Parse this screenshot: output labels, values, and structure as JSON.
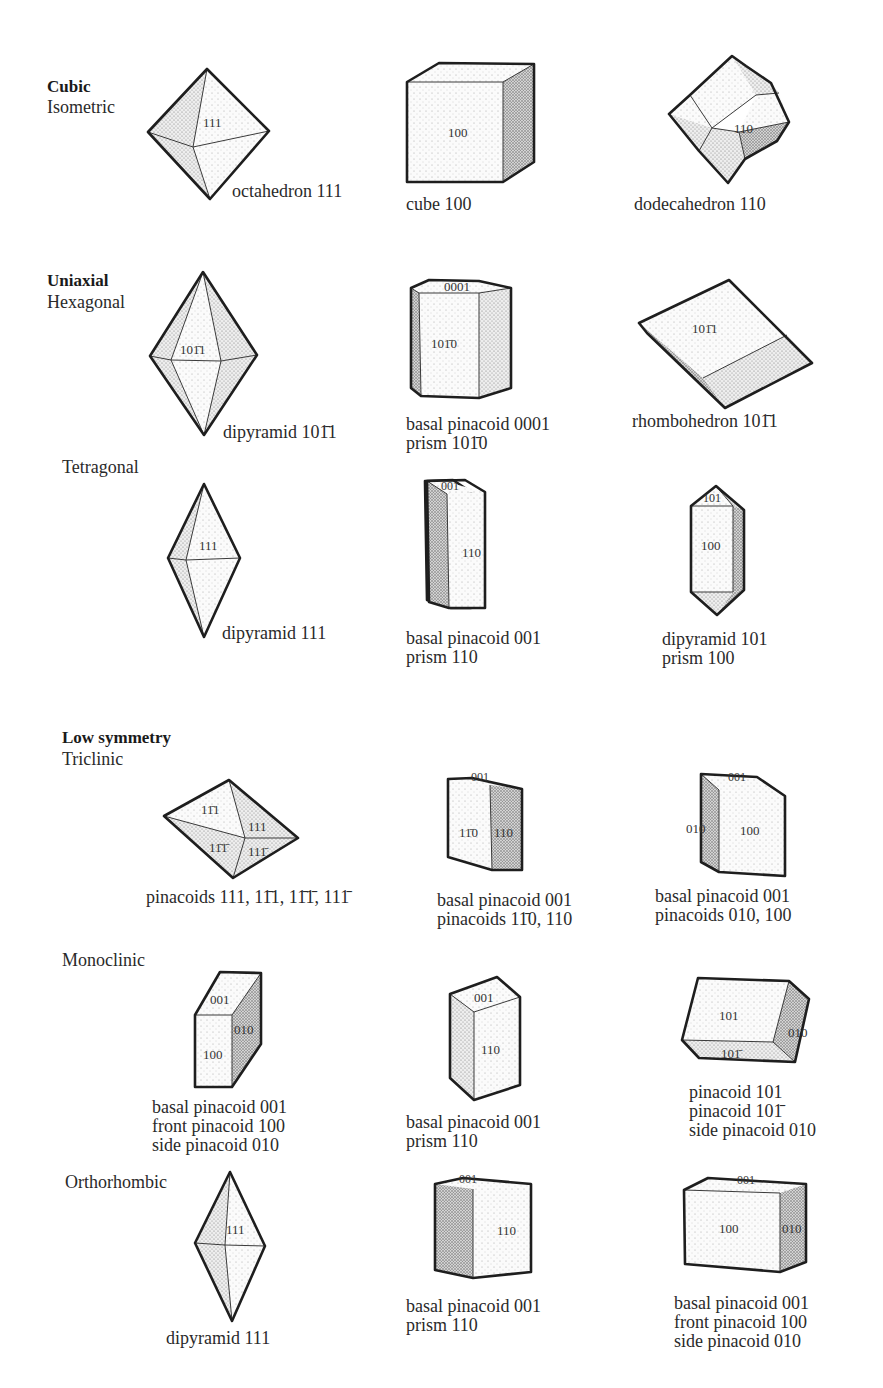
{
  "groups": {
    "cubic": {
      "title": "Cubic",
      "systems": {
        "isometric": "Isometric"
      }
    },
    "uniaxial": {
      "title": "Uniaxial",
      "systems": {
        "hexagonal": "Hexagonal",
        "tetragonal": "Tetragonal"
      }
    },
    "low_symmetry": {
      "title": "Low symmetry",
      "systems": {
        "triclinic": "Triclinic",
        "monoclinic": "Monoclinic",
        "orthorhombic": "Orthorhombic"
      }
    }
  },
  "crystals": {
    "octahedron": {
      "face": "111",
      "caption": [
        "octahedron 111"
      ]
    },
    "cube": {
      "face": "100",
      "caption": [
        "cube 100"
      ]
    },
    "dodecahedron": {
      "face": "110",
      "caption": [
        "dodecahedron 110"
      ]
    },
    "hex_dipyramid": {
      "face": "101̄1",
      "caption": [
        "dipyramid 101̄1"
      ]
    },
    "hex_prism": {
      "faces": [
        "0001",
        "101̄0"
      ],
      "caption": [
        "basal pinacoid 0001",
        "prism 101̄0"
      ]
    },
    "rhombohedron": {
      "face": "101̄1",
      "caption": [
        "rhombohedron 101̄1"
      ]
    },
    "tet_dipyramid": {
      "face": "111",
      "caption": [
        "dipyramid 111"
      ]
    },
    "tet_prism": {
      "faces": [
        "001",
        "110"
      ],
      "caption": [
        "basal pinacoid 001",
        "prism 110"
      ]
    },
    "tet_prism_dipyramid": {
      "faces": [
        "101",
        "100"
      ],
      "caption": [
        "dipyramid 101",
        "prism 100"
      ]
    },
    "tri_pinacoids": {
      "faces": [
        "11̄1",
        "111",
        "11̄1̄",
        "111̄"
      ],
      "caption": [
        "pinacoids 111, 11̄1, 11̄1̄, 111̄"
      ]
    },
    "tri_prism_a": {
      "faces": [
        "001",
        "11̄0",
        "110"
      ],
      "caption": [
        "basal pinacoid 001",
        "pinacoids 11̄0, 110"
      ]
    },
    "tri_prism_b": {
      "faces": [
        "001",
        "010",
        "100"
      ],
      "caption": [
        "basal pinacoid 001",
        "pinacoids 010, 100"
      ]
    },
    "mono_a": {
      "faces": [
        "001",
        "010",
        "100"
      ],
      "caption": [
        "basal pinacoid 001",
        "front pinacoid 100",
        "side pinacoid 010"
      ]
    },
    "mono_b": {
      "faces": [
        "001",
        "110"
      ],
      "caption": [
        "basal pinacoid 001",
        "prism 110"
      ]
    },
    "mono_c": {
      "faces": [
        "101",
        "010",
        "101̄"
      ],
      "caption": [
        "pinacoid 101",
        "pinacoid 101̄",
        "side pinacoid 010"
      ]
    },
    "ortho_dipyramid": {
      "face": "111",
      "caption": [
        "dipyramid 111"
      ]
    },
    "ortho_prism": {
      "faces": [
        "001",
        "110"
      ],
      "caption": [
        "basal pinacoid 001",
        "prism 110"
      ]
    },
    "ortho_box": {
      "faces": [
        "001",
        "100",
        "010"
      ],
      "caption": [
        "basal pinacoid 001",
        "front pinacoid 100",
        "side pinacoid 010"
      ]
    }
  }
}
